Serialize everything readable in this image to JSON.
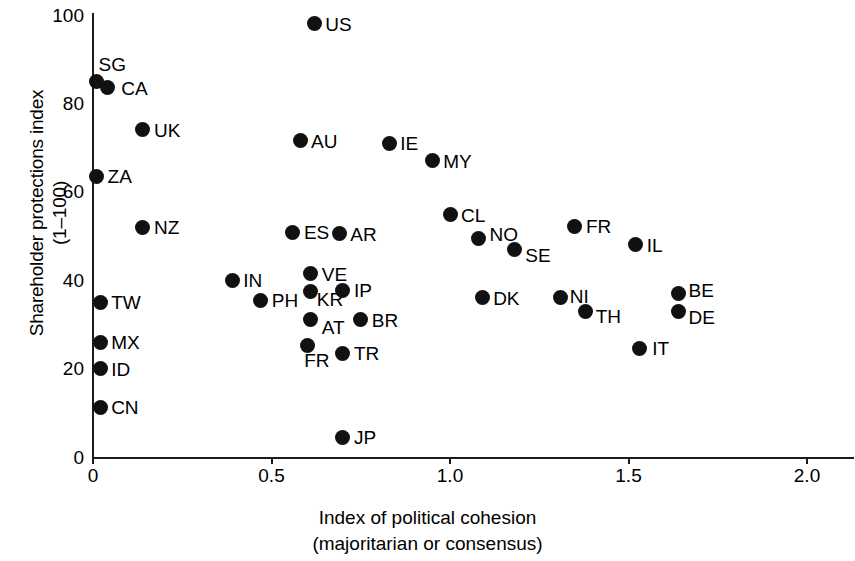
{
  "chart_data": {
    "type": "scatter",
    "title": "",
    "xlabel": "Index of political cohesion",
    "xlabel_line2": "(majoritarian or consensus)",
    "ylabel": "Shareholder protections index",
    "ylabel_line2": "(1–100)",
    "xlim": [
      0,
      2.13
    ],
    "ylim": [
      0,
      100
    ],
    "xticks": [
      "0",
      "0.5",
      "1.0",
      "1.5",
      "2.0"
    ],
    "xtick_values": [
      0,
      0.5,
      1.0,
      1.5,
      2.0
    ],
    "yticks": [
      "0",
      "20",
      "40",
      "60",
      "80",
      "100"
    ],
    "ytick_values": [
      0,
      20,
      40,
      60,
      80,
      100
    ],
    "grid": false,
    "legend": "none",
    "marker_color": "#111111",
    "axis_color": "#1a1a1a",
    "points": [
      {
        "label": "US",
        "x": 0.62,
        "y": 98,
        "lx": 11,
        "ly": -9
      },
      {
        "label": "SG",
        "x": 0.01,
        "y": 85,
        "lx": 2,
        "ly": -26
      },
      {
        "label": "CA",
        "x": 0.04,
        "y": 83.5,
        "lx": 14,
        "ly": -9
      },
      {
        "label": "UK",
        "x": 0.14,
        "y": 74,
        "lx": 11,
        "ly": -9
      },
      {
        "label": "ZA",
        "x": 0.01,
        "y": 63.5,
        "lx": 11,
        "ly": -9
      },
      {
        "label": "NZ",
        "x": 0.14,
        "y": 52,
        "lx": 11,
        "ly": -9
      },
      {
        "label": "TW",
        "x": 0.02,
        "y": 35,
        "lx": 11,
        "ly": -9
      },
      {
        "label": "MX",
        "x": 0.02,
        "y": 26,
        "lx": 11,
        "ly": -9
      },
      {
        "label": "ID",
        "x": 0.02,
        "y": 20,
        "lx": 11,
        "ly": -9
      },
      {
        "label": "CN",
        "x": 0.02,
        "y": 11.3,
        "lx": 11,
        "ly": -9
      },
      {
        "label": "AU",
        "x": 0.58,
        "y": 71.5,
        "lx": 11,
        "ly": -9
      },
      {
        "label": "IE",
        "x": 0.83,
        "y": 71,
        "lx": 11,
        "ly": -9
      },
      {
        "label": "MY",
        "x": 0.95,
        "y": 67,
        "lx": 11,
        "ly": -9
      },
      {
        "label": "ES",
        "x": 0.56,
        "y": 50.8,
        "lx": 11,
        "ly": -9
      },
      {
        "label": "AR",
        "x": 0.69,
        "y": 50.5,
        "lx": 11,
        "ly": -9
      },
      {
        "label": "VE",
        "x": 0.61,
        "y": 41.5,
        "lx": 11,
        "ly": -9
      },
      {
        "label": "IN",
        "x": 0.39,
        "y": 40,
        "lx": 11,
        "ly": -9
      },
      {
        "label": "PH",
        "x": 0.47,
        "y": 35.5,
        "lx": 11,
        "ly": -9
      },
      {
        "label": "KR",
        "x": 0.61,
        "y": 37.5,
        "lx": 6,
        "ly": -1
      },
      {
        "label": "IP",
        "x": 0.7,
        "y": 37.7,
        "lx": 11,
        "ly": -9
      },
      {
        "label": "AT",
        "x": 0.61,
        "y": 31,
        "lx": 11,
        "ly": -2
      },
      {
        "label": "BR",
        "x": 0.75,
        "y": 31,
        "lx": 11,
        "ly": -9
      },
      {
        "label": "FR",
        "x": 0.6,
        "y": 25.2,
        "lx": -3,
        "ly": 5
      },
      {
        "label": "TR",
        "x": 0.7,
        "y": 23.5,
        "lx": 11,
        "ly": -9
      },
      {
        "label": "JP",
        "x": 0.7,
        "y": 4.5,
        "lx": 11,
        "ly": -9
      },
      {
        "label": "CL",
        "x": 1.0,
        "y": 54.8,
        "lx": 11,
        "ly": -9
      },
      {
        "label": "NO",
        "x": 1.08,
        "y": 49.5,
        "lx": 11,
        "ly": -13
      },
      {
        "label": "SE",
        "x": 1.18,
        "y": 47,
        "lx": 11,
        "ly": -3
      },
      {
        "label": "FR",
        "x": 1.35,
        "y": 52.2,
        "lx": 11,
        "ly": -9
      },
      {
        "label": "IL",
        "x": 1.52,
        "y": 48,
        "lx": 11,
        "ly": -9
      },
      {
        "label": "DK",
        "x": 1.09,
        "y": 36,
        "lx": 11,
        "ly": -9
      },
      {
        "label": "NI",
        "x": 1.31,
        "y": 36,
        "lx": 9,
        "ly": -11
      },
      {
        "label": "TH",
        "x": 1.38,
        "y": 33,
        "lx": 10,
        "ly": -4
      },
      {
        "label": "BE",
        "x": 1.64,
        "y": 37,
        "lx": 10,
        "ly": -12
      },
      {
        "label": "DE",
        "x": 1.64,
        "y": 33,
        "lx": 10,
        "ly": -3
      },
      {
        "label": "IT",
        "x": 1.53,
        "y": 24.6,
        "lx": 13,
        "ly": -9
      }
    ]
  }
}
